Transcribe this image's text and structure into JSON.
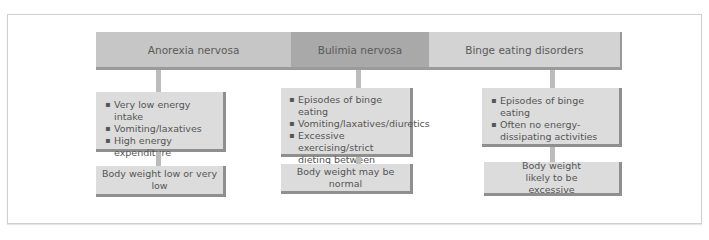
{
  "diagram": {
    "headers": [
      {
        "label": "Anorexia nervosa",
        "color": "#c6c6c6"
      },
      {
        "label": "Bulimia nervosa",
        "color": "#a9a9a9"
      },
      {
        "label": "Binge eating disorders",
        "color": "#d3d3d3"
      }
    ],
    "columns": [
      {
        "characteristics": [
          "Very low energy intake",
          "Vomiting/laxatives",
          "High energy expenditure"
        ],
        "outcome": "Body weight low or very low"
      },
      {
        "characteristics": [
          "Episodes of binge eating",
          "Vomiting/laxatives/diuretics",
          "Excessive exercising/strict dieting between binges"
        ],
        "outcome": "Body weight may be normal"
      },
      {
        "characteristics": [
          "Episodes of binge eating",
          "Often no energy-dissipating activities"
        ],
        "outcome": "Body weight likely to be excessive"
      }
    ]
  }
}
